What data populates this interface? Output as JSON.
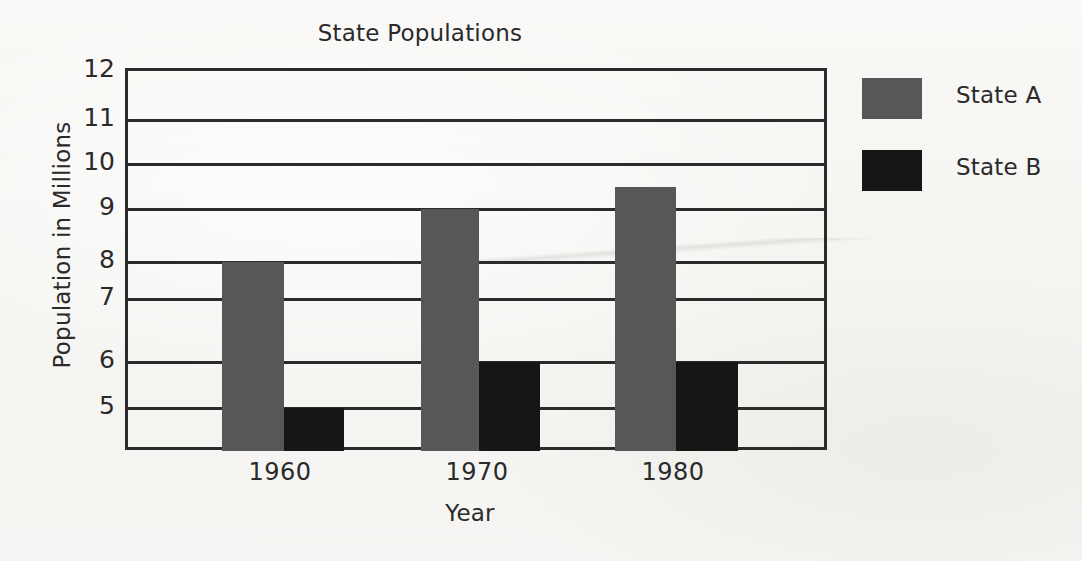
{
  "chart_data": {
    "type": "bar",
    "title": "State Populations",
    "xlabel": "Year",
    "ylabel": "Population in Millions",
    "categories": [
      "1960",
      "1970",
      "1980"
    ],
    "series": [
      {
        "name": "State A",
        "color": "#575757",
        "values": [
          8,
          9,
          9.5
        ]
      },
      {
        "name": "State B",
        "color": "#161616",
        "values": [
          5,
          6,
          6
        ]
      }
    ],
    "ytick_labels": [
      "12",
      "11",
      "10",
      "9",
      "8",
      "7",
      "6",
      "5"
    ],
    "ytick_values": [
      12,
      11,
      10,
      9,
      8,
      7,
      6,
      5
    ],
    "ylim": [
      4,
      12
    ],
    "grid": true,
    "grid_axis": "y",
    "legend_position": "right",
    "bar_grouping": "grouped",
    "plot_background": "#f7f7f5",
    "axis_color": "#2b2b2b"
  },
  "legend": {
    "items": [
      {
        "label": "State A",
        "color": "#575757"
      },
      {
        "label": "State B",
        "color": "#161616"
      }
    ]
  }
}
